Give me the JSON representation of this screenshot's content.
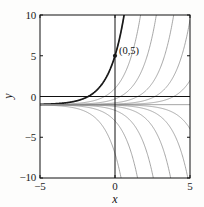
{
  "figure": {
    "background_color": "#fdfdfc",
    "plot_area": {
      "left": 40,
      "top": 15,
      "right": 190,
      "bottom": 178
    },
    "axis_color": "#111111",
    "curve_color": "#8a8a8a",
    "highlight_color": "#1a1a1a"
  },
  "chart_data": {
    "type": "line",
    "title": "",
    "xlabel": "x",
    "ylabel": "y",
    "xlim": [
      -5,
      5
    ],
    "ylim": [
      -10,
      10
    ],
    "xticks": [
      -5,
      0,
      5
    ],
    "xtick_labels": [
      "−5",
      "0",
      "5"
    ],
    "yticks": [
      -10,
      -5,
      0,
      5,
      10
    ],
    "ytick_labels": [
      "−10",
      "−5",
      "0",
      "5",
      "10"
    ],
    "grid": false,
    "legend": "none",
    "asymptote": -1,
    "annotations": [
      {
        "text": "(0,5)",
        "x": 0,
        "y": 5,
        "marker": "filled-dot"
      }
    ],
    "series": [
      {
        "name": "C = 6",
        "constant": 6,
        "style": "thin-gray",
        "formula": "y = 6*exp(x) - 1"
      },
      {
        "name": "C = 2",
        "constant": 2,
        "style": "thin-gray",
        "formula": "y = 2*exp(x) - 1"
      },
      {
        "name": "C = 0.7",
        "constant": 0.7,
        "style": "thin-gray",
        "formula": "y = 0.7*exp(x) - 1"
      },
      {
        "name": "C = 0.22",
        "constant": 0.22,
        "style": "thin-gray",
        "formula": "y = 0.22*exp(x) - 1"
      },
      {
        "name": "C = 0.07",
        "constant": 0.07,
        "style": "thin-gray",
        "formula": "y = 0.07*exp(x) - 1"
      },
      {
        "name": "C = 0.02",
        "constant": 0.02,
        "style": "thin-gray",
        "formula": "y = 0.02*exp(x) - 1"
      },
      {
        "name": "C = 6 (particular)",
        "constant": 6,
        "style": "bold-dark",
        "formula": "y = 6*exp(x) - 1",
        "through": [
          0,
          5
        ]
      },
      {
        "name": "C = -0.02",
        "constant": -0.02,
        "style": "thin-gray",
        "formula": "y = -0.02*exp(x) - 1"
      },
      {
        "name": "C = -0.07",
        "constant": -0.07,
        "style": "thin-gray",
        "formula": "y = -0.07*exp(x) - 1"
      },
      {
        "name": "C = -0.22",
        "constant": -0.22,
        "style": "thin-gray",
        "formula": "y = -0.22*exp(x) - 1"
      },
      {
        "name": "C = -0.7",
        "constant": -0.7,
        "style": "thin-gray",
        "formula": "y = -0.7*exp(x) - 1"
      },
      {
        "name": "C = -2",
        "constant": -2,
        "style": "thin-gray",
        "formula": "y = -2*exp(x) - 1"
      },
      {
        "name": "C = -6",
        "constant": -6,
        "style": "thin-gray",
        "formula": "y = -6*exp(x) - 1"
      }
    ]
  },
  "labels": {
    "xaxis_title": "x",
    "yaxis_title": "y",
    "ytick_10": "10",
    "ytick_5": "5",
    "ytick_0": "0",
    "ytick_neg5": "−5",
    "ytick_neg10": "−10",
    "xtick_neg5": "−5",
    "xtick_0": "0",
    "xtick_5": "5",
    "point_label": "(0,5)"
  }
}
